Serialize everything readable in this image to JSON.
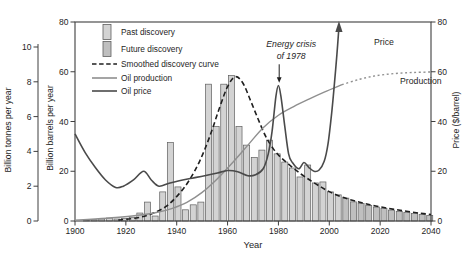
{
  "chart_data": {
    "type": "bar",
    "title": "",
    "xlabel": "Year",
    "x_range": [
      1900,
      2040
    ],
    "x_ticks": [
      1900,
      1920,
      1940,
      1960,
      1980,
      2000,
      2020,
      2040
    ],
    "axes": {
      "left_outer": {
        "label": "Billion tonnes per year",
        "ticks": [
          0,
          2,
          4,
          6,
          8,
          10
        ],
        "range": [
          0,
          10
        ]
      },
      "left_inner": {
        "label": "Billion barrels per year",
        "ticks": [
          0,
          20,
          40,
          60,
          80
        ],
        "range": [
          0,
          80
        ]
      },
      "right": {
        "label": "Price ($/barrel)",
        "ticks": [
          0,
          20,
          40,
          60,
          80
        ],
        "range": [
          0,
          80
        ]
      }
    },
    "bars": {
      "unit": "billion barrels per year",
      "bin_width_years": 3,
      "future_from_year": 2005,
      "start_years": [
        1903,
        1906,
        1909,
        1912,
        1915,
        1918,
        1921,
        1924,
        1927,
        1930,
        1933,
        1936,
        1939,
        1942,
        1945,
        1948,
        1951,
        1954,
        1957,
        1960,
        1963,
        1966,
        1969,
        1972,
        1975,
        1978,
        1981,
        1984,
        1987,
        1990,
        1993,
        1996,
        1999,
        2002,
        2005,
        2008,
        2011,
        2014,
        2017,
        2020,
        2023,
        2026,
        2029,
        2032,
        2035,
        2038
      ],
      "values": [
        0.3,
        0.5,
        0.8,
        1.2,
        0.8,
        1.0,
        1.5,
        3.2,
        7.6,
        2.0,
        11.7,
        31.5,
        13.7,
        4.5,
        6.5,
        7.6,
        55,
        38,
        55,
        58.5,
        38,
        30.5,
        25.5,
        28.5,
        32.5,
        27,
        23.7,
        21.3,
        17.7,
        22.5,
        15.3,
        15.7,
        11.7,
        10.5,
        9.2,
        7.7,
        7.0,
        6.3,
        5.6,
        5.0,
        4.4,
        3.9,
        3.4,
        3.0,
        2.6,
        2.2
      ]
    },
    "series": [
      {
        "name": "Smoothed discovery curve",
        "style": "dashed",
        "color_key": "discovery_curve",
        "points": [
          [
            1917,
            0.4
          ],
          [
            1924,
            1.2
          ],
          [
            1930,
            2.8
          ],
          [
            1936,
            6
          ],
          [
            1941,
            11
          ],
          [
            1945,
            16.5
          ],
          [
            1949,
            24
          ],
          [
            1953,
            34
          ],
          [
            1957,
            46
          ],
          [
            1960,
            54
          ],
          [
            1963,
            58
          ],
          [
            1966,
            55.5
          ],
          [
            1969,
            48.5
          ],
          [
            1972,
            41
          ],
          [
            1975,
            34
          ],
          [
            1978,
            29
          ],
          [
            1981,
            25.5
          ],
          [
            1985,
            22
          ],
          [
            1989,
            18.8
          ],
          [
            1993,
            16
          ],
          [
            1997,
            13.5
          ],
          [
            2001,
            11.3
          ],
          [
            2006,
            9.3
          ],
          [
            2011,
            7.8
          ],
          [
            2016,
            6.5
          ],
          [
            2021,
            5.5
          ],
          [
            2026,
            4.6
          ],
          [
            2031,
            3.8
          ],
          [
            2036,
            3.1
          ],
          [
            2040,
            2.6
          ]
        ]
      },
      {
        "name": "Oil production",
        "style": "solid",
        "color_key": "production",
        "points": [
          [
            1900,
            0.3
          ],
          [
            1908,
            0.8
          ],
          [
            1916,
            1.4
          ],
          [
            1924,
            2.2
          ],
          [
            1932,
            3.4
          ],
          [
            1938,
            5
          ],
          [
            1944,
            7.5
          ],
          [
            1950,
            11.5
          ],
          [
            1956,
            17
          ],
          [
            1962,
            23.5
          ],
          [
            1968,
            30.5
          ],
          [
            1974,
            37.5
          ],
          [
            1980,
            42.5
          ],
          [
            1986,
            46
          ],
          [
            1992,
            49
          ],
          [
            1998,
            51.8
          ],
          [
            2005,
            54.8
          ]
        ]
      },
      {
        "name": "Oil production (projected)",
        "style": "dotted",
        "color_key": "production",
        "points": [
          [
            2005,
            54.8
          ],
          [
            2012,
            57
          ],
          [
            2019,
            58.5
          ],
          [
            2026,
            59.3
          ],
          [
            2033,
            59.7
          ],
          [
            2040,
            59.9
          ]
        ]
      },
      {
        "name": "Oil price",
        "style": "solid",
        "color_key": "price",
        "arrow_end": true,
        "points": [
          [
            1900,
            35
          ],
          [
            1904,
            27.5
          ],
          [
            1908,
            21.5
          ],
          [
            1912,
            16.5
          ],
          [
            1916,
            13.5
          ],
          [
            1919,
            14
          ],
          [
            1923,
            16.5
          ],
          [
            1927,
            20
          ],
          [
            1930,
            16.5
          ],
          [
            1933,
            14
          ],
          [
            1937,
            15.2
          ],
          [
            1941,
            16.2
          ],
          [
            1946,
            17.2
          ],
          [
            1951,
            18.2
          ],
          [
            1956,
            19.3
          ],
          [
            1960,
            20.3
          ],
          [
            1964,
            19.8
          ],
          [
            1968,
            18.2
          ],
          [
            1971,
            18.6
          ],
          [
            1974,
            21
          ],
          [
            1976,
            27
          ],
          [
            1977.5,
            36
          ],
          [
            1979,
            50
          ],
          [
            1980,
            54.5
          ],
          [
            1981,
            50
          ],
          [
            1982.5,
            38
          ],
          [
            1984,
            27
          ],
          [
            1985.5,
            23.5
          ],
          [
            1988,
            21
          ],
          [
            1990,
            23.5
          ],
          [
            1992,
            21.5
          ],
          [
            1994,
            20
          ],
          [
            1996,
            20.5
          ],
          [
            1998,
            24
          ],
          [
            1999.5,
            31
          ],
          [
            2001,
            44
          ],
          [
            2002,
            55
          ],
          [
            2003,
            67
          ],
          [
            2003.8,
            78
          ]
        ]
      }
    ],
    "legend": {
      "items": [
        {
          "swatch": "bar-past",
          "label": "Past discovery"
        },
        {
          "swatch": "bar-future",
          "label": "Future discovery"
        },
        {
          "swatch": "line-dashed",
          "label": "Smoothed discovery curve"
        },
        {
          "swatch": "line-production",
          "label": "Oil production"
        },
        {
          "swatch": "line-price",
          "label": "Oil price"
        }
      ]
    },
    "annotations": [
      {
        "id": "energy-crisis",
        "lines": [
          "Energy crisis",
          "of 1978"
        ],
        "year": 1985,
        "values": [
          71,
          66.5
        ],
        "italic": true,
        "arrow": {
          "year": 1980.3,
          "from_value": 63,
          "to_value": 56.2
        }
      },
      {
        "id": "price-label",
        "lines": [
          "Price"
        ],
        "year": 2021.5,
        "values": [
          72
        ],
        "italic": false
      },
      {
        "id": "production-label",
        "lines": [
          "Production"
        ],
        "year": 2036,
        "values": [
          56.3
        ],
        "italic": false
      }
    ],
    "colors": {
      "bar_past": "#d3d3d3",
      "bar_future": "#bfbfbf",
      "bar_stroke": "#5f5f5f",
      "discovery_curve": "#1f1f1f",
      "production": "#8f8f8f",
      "price": "#4a4a4a",
      "frame": "#3f3f3f",
      "text": "#1e1e1e"
    }
  }
}
